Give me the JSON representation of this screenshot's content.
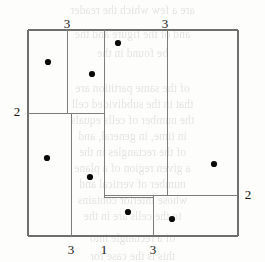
{
  "figure": {
    "caption_like_labels": {
      "top_left": "3",
      "top_right": "3",
      "left": "2",
      "right": "2",
      "bottom_left": "3",
      "bottom_middle": "1",
      "bottom_right": "3"
    },
    "colors": {
      "line": "#7d7d7d",
      "outer_line": "#6f6f6f",
      "dot": "#0a0a0a",
      "label_text": "#16140f",
      "background": "#fdfdfc",
      "bleed_text": "#5d5a52"
    },
    "outer_rect": {
      "x": 28,
      "y": 30,
      "width": 210,
      "height": 206
    },
    "segments": [
      {
        "name": "outer-top",
        "x1": 28,
        "y1": 30,
        "x2": 238,
        "y2": 30
      },
      {
        "name": "outer-right",
        "x1": 238,
        "y1": 30,
        "x2": 238,
        "y2": 236
      },
      {
        "name": "outer-bottom",
        "x1": 28,
        "y1": 236,
        "x2": 238,
        "y2": 236
      },
      {
        "name": "outer-left",
        "x1": 28,
        "y1": 30,
        "x2": 28,
        "y2": 236
      },
      {
        "name": "vertical-upper-left",
        "x1": 67,
        "y1": 30,
        "x2": 67,
        "y2": 113
      },
      {
        "name": "vertical-center",
        "x1": 104,
        "y1": 30,
        "x2": 104,
        "y2": 197
      },
      {
        "name": "vertical-upper-right",
        "x1": 167,
        "y1": 30,
        "x2": 167,
        "y2": 195
      },
      {
        "name": "vertical-lower-left",
        "x1": 71,
        "y1": 113,
        "x2": 71,
        "y2": 236
      },
      {
        "name": "vertical-lower-right",
        "x1": 153,
        "y1": 195,
        "x2": 153,
        "y2": 236
      },
      {
        "name": "horizontal-left",
        "x1": 28,
        "y1": 113,
        "x2": 104,
        "y2": 113
      },
      {
        "name": "horizontal-bottom",
        "x1": 104,
        "y1": 195,
        "x2": 238,
        "y2": 195
      },
      {
        "name": "horizontal-notch",
        "x1": 104,
        "y1": 197,
        "x2": 153,
        "y2": 197
      }
    ],
    "dots": [
      {
        "name": "dot-1",
        "x": 48,
        "y": 62
      },
      {
        "name": "dot-2",
        "x": 92,
        "y": 74
      },
      {
        "name": "dot-3",
        "x": 118,
        "y": 43
      },
      {
        "name": "dot-4",
        "x": 47,
        "y": 158
      },
      {
        "name": "dot-5",
        "x": 214,
        "y": 164
      },
      {
        "name": "dot-6",
        "x": 90,
        "y": 177
      },
      {
        "name": "dot-7",
        "x": 128,
        "y": 212
      },
      {
        "name": "dot-8",
        "x": 172,
        "y": 219
      }
    ],
    "dot_radius": 3.1,
    "labels": [
      {
        "name": "label-top-left",
        "key": "top_left",
        "x": 59,
        "y": 17
      },
      {
        "name": "label-top-right",
        "key": "top_right",
        "x": 157,
        "y": 17
      },
      {
        "name": "label-left",
        "key": "left",
        "x": 9,
        "y": 105
      },
      {
        "name": "label-right",
        "key": "right",
        "x": 240,
        "y": 188
      },
      {
        "name": "label-bottom-left",
        "key": "bottom_left",
        "x": 63,
        "y": 243
      },
      {
        "name": "label-bottom-middle",
        "key": "bottom_middle",
        "x": 96,
        "y": 243
      },
      {
        "name": "label-bottom-right",
        "key": "bottom_right",
        "x": 145,
        "y": 243
      }
    ],
    "bleed_lines": [
      {
        "text": "are a few which the reader",
        "x": 0,
        "y": 4
      },
      {
        "text": "and of the figure and the",
        "x": 0,
        "y": 28
      },
      {
        "text": "be found in the",
        "x": 0,
        "y": 47
      },
      {
        "text": "of the same partition are",
        "x": 0,
        "y": 82
      },
      {
        "text": "that in the subdivided cell",
        "x": 0,
        "y": 98
      },
      {
        "text": "the number of cells equals",
        "x": 0,
        "y": 114
      },
      {
        "text": "in time, in general, and",
        "x": 0,
        "y": 130
      },
      {
        "text": "of the rectangles in the",
        "x": 0,
        "y": 146
      },
      {
        "text": "a given region of a plane",
        "x": 0,
        "y": 162
      },
      {
        "text": "number of vertical and",
        "x": 0,
        "y": 178
      },
      {
        "text": "whose interior contains",
        "x": 0,
        "y": 194
      },
      {
        "text": "to the cells are in the",
        "x": 0,
        "y": 210
      },
      {
        "text": "of a rectangle into",
        "x": 0,
        "y": 232
      },
      {
        "text": "this is the case for",
        "x": 0,
        "y": 250
      }
    ]
  }
}
